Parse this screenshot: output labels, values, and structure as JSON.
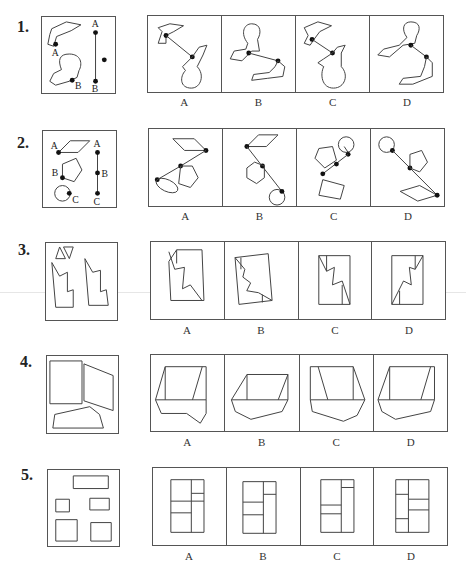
{
  "questions": [
    {
      "number": "1.",
      "question_figure": "two-shapes-with-points-A-B-and-segment-AB",
      "question_labels": {
        "shape_point_a": "A",
        "shape_point_b": "B",
        "segment_top": "A",
        "segment_bottom": "B"
      },
      "options": [
        "A",
        "B",
        "C",
        "D"
      ]
    },
    {
      "number": "2.",
      "question_figure": "parallelogram-pentagon-circle-with-points-A-B-C-and-segment-ABC",
      "question_labels": {
        "shape_point_a": "A",
        "shape_point_b": "B",
        "shape_point_c": "C",
        "segment_a": "A",
        "segment_b": "B",
        "segment_c": "C"
      },
      "options": [
        "A",
        "B",
        "C",
        "D"
      ]
    },
    {
      "number": "3.",
      "question_figure": "two-triangles-and-two-zigzag-pieces",
      "options": [
        "A",
        "B",
        "C",
        "D"
      ]
    },
    {
      "number": "4.",
      "question_figure": "rectangle-parallelogram-and-pentagon-pieces",
      "options": [
        "A",
        "B",
        "C",
        "D"
      ]
    },
    {
      "number": "5.",
      "question_figure": "five-rectangles",
      "options": [
        "A",
        "B",
        "C",
        "D"
      ]
    }
  ]
}
